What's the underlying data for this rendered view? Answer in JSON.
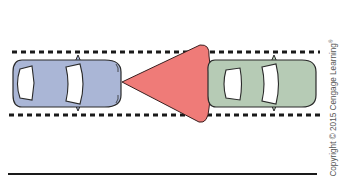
{
  "diagram": {
    "elements": {
      "lane_top": {
        "type": "dashed-line",
        "y": 52
      },
      "lane_bottom": {
        "type": "dashed-line",
        "y": 115
      },
      "rear_car": {
        "label": "blue car",
        "color": "#aab6d6",
        "direction": "right"
      },
      "front_car": {
        "label": "green car",
        "color": "#b6cbb5",
        "direction": "right"
      },
      "detection_cone": {
        "label": "sensor cone",
        "color": "#ef7b78"
      },
      "ground_line": {
        "type": "solid-line",
        "y": 174
      }
    }
  },
  "colors": {
    "rear_car": "#aab6d6",
    "front_car": "#b6cbb5",
    "cone": "#ef7b78",
    "outline": "#2a2a2a",
    "window": "#ffffff"
  },
  "copyright": {
    "text": "Copyright © 2015 Cengage Learning",
    "mark": "®"
  }
}
